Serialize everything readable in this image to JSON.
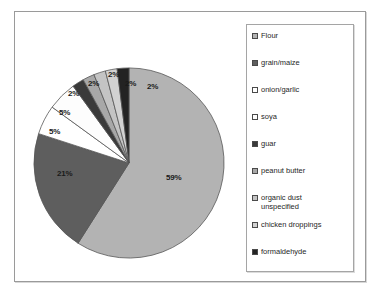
{
  "figure": {
    "background_color": "#ffffff",
    "frame_color": "#9a9a9a"
  },
  "chart_data": {
    "type": "pie",
    "title": "",
    "subtitle": "",
    "xlabel": "",
    "ylabel": "",
    "legend_position": "right",
    "grid": false,
    "start_angle_deg": 0,
    "direction": "clockwise",
    "categories": [
      "Flour",
      "grain/maize",
      "onion/garlic",
      "soya",
      "guar",
      "peanut butter",
      "organic dust unspecified",
      "chicken droppings",
      "formaldehyde"
    ],
    "values": [
      59,
      21,
      5,
      5,
      2,
      2,
      2,
      2,
      2
    ],
    "value_labels": [
      "59%",
      "21%",
      "5%",
      "5%",
      "2%",
      "2%",
      "2%",
      "2%",
      "2%"
    ],
    "units": "percent",
    "colors": [
      "#b3b3b3",
      "#5e5e5e",
      "#ffffff",
      "#fdfdfd",
      "#3a3a3a",
      "#a8a8a8",
      "#c4c4c4",
      "#d2d2d2",
      "#232323"
    ],
    "slice_edge_color": "#555555"
  },
  "slice_labels": [
    {
      "text": "59%",
      "left": 152,
      "top": 134
    },
    {
      "text": "21%",
      "left": 43,
      "top": 130
    },
    {
      "text": "5%",
      "left": 35,
      "top": 88
    },
    {
      "text": "5%",
      "left": 45,
      "top": 69
    },
    {
      "text": "2%",
      "left": 54,
      "top": 50
    },
    {
      "text": "2%",
      "left": 74,
      "top": 40
    },
    {
      "text": "2%",
      "left": 94,
      "top": 31
    },
    {
      "text": "2%",
      "left": 111,
      "top": 40
    },
    {
      "text": "2%",
      "left": 133,
      "top": 43
    }
  ],
  "legend": {
    "items": [
      {
        "label": "Flour",
        "swatch_color": "#b3b3b3"
      },
      {
        "label": "grain/maize",
        "swatch_color": "#5e5e5e"
      },
      {
        "label": "onion/garlic",
        "swatch_color": "#ffffff"
      },
      {
        "label": "soya",
        "swatch_color": "#fdfdfd"
      },
      {
        "label": "guar",
        "swatch_color": "#3a3a3a"
      },
      {
        "label": "peanut butter",
        "swatch_color": "#a8a8a8"
      },
      {
        "label": "organic dust\nunspecified",
        "swatch_color": "#c4c4c4"
      },
      {
        "label": "chicken droppings",
        "swatch_color": "#d2d2d2"
      },
      {
        "label": "formaldehyde",
        "swatch_color": "#232323"
      }
    ]
  }
}
